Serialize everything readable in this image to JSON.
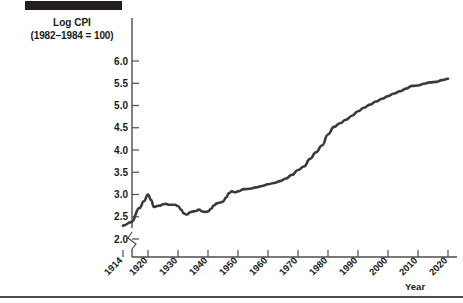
{
  "figure": {
    "header_bar_color": "#231f20",
    "rule_color": "#4d4d4d",
    "line_color": "#3a3a3a"
  },
  "axis_labels": {
    "y_title_line1": "Log CPI",
    "y_title_line2": "(1982–1984 = 100)",
    "x_title": "Year"
  },
  "chart_data": {
    "type": "line",
    "title": "Log CPI (1982–1984 = 100)",
    "xlabel": "Year",
    "ylabel": "Log CPI (1982–1984 = 100)",
    "grid": false,
    "legend": null,
    "xlim": [
      1914,
      2020
    ],
    "ylim": [
      2.0,
      6.0
    ],
    "y_axis_break": true,
    "y_axis_break_note": "zigzag break below 2.0",
    "yticks": [
      2.0,
      2.5,
      3.0,
      3.5,
      4.0,
      4.5,
      5.0,
      5.5,
      6.0
    ],
    "ytick_labels": [
      "2.0",
      "2.5",
      "3.0",
      "3.5",
      "4.0",
      "4.5",
      "5.0",
      "5.5",
      "6.0"
    ],
    "xticks": [
      1914,
      1920,
      1930,
      1940,
      1950,
      1960,
      1970,
      1980,
      1990,
      2000,
      2010,
      2020
    ],
    "xtick_labels": [
      "1914",
      "1920",
      "1930",
      "1940",
      "1950",
      "1960",
      "1970",
      "1980",
      "1990",
      "2000",
      "2010",
      "2020"
    ],
    "series": [
      {
        "name": "Log CPI",
        "x": [
          1914,
          1916,
          1918,
          1919,
          1920,
          1921,
          1922,
          1923,
          1924,
          1925,
          1926,
          1927,
          1928,
          1929,
          1930,
          1931,
          1932,
          1933,
          1934,
          1935,
          1936,
          1937,
          1938,
          1939,
          1940,
          1941,
          1942,
          1943,
          1944,
          1945,
          1946,
          1947,
          1948,
          1949,
          1950,
          1952,
          1954,
          1956,
          1958,
          1960,
          1962,
          1964,
          1966,
          1968,
          1970,
          1972,
          1974,
          1976,
          1978,
          1980,
          1982,
          1984,
          1986,
          1988,
          1990,
          1992,
          1994,
          1996,
          1998,
          2000,
          2002,
          2004,
          2006,
          2008,
          2010,
          2012,
          2014,
          2016,
          2018,
          2020
        ],
        "y": [
          2.3,
          2.38,
          2.7,
          2.85,
          3.0,
          2.88,
          2.72,
          2.74,
          2.75,
          2.78,
          2.79,
          2.77,
          2.77,
          2.77,
          2.74,
          2.66,
          2.57,
          2.55,
          2.6,
          2.62,
          2.63,
          2.66,
          2.62,
          2.61,
          2.62,
          2.68,
          2.76,
          2.8,
          2.82,
          2.84,
          2.93,
          3.03,
          3.07,
          3.05,
          3.07,
          3.12,
          3.13,
          3.16,
          3.19,
          3.23,
          3.26,
          3.3,
          3.36,
          3.44,
          3.55,
          3.63,
          3.8,
          3.95,
          4.1,
          4.35,
          4.52,
          4.6,
          4.68,
          4.77,
          4.87,
          4.95,
          5.02,
          5.09,
          5.15,
          5.21,
          5.27,
          5.32,
          5.38,
          5.44,
          5.45,
          5.49,
          5.52,
          5.53,
          5.57,
          5.6
        ]
      }
    ]
  }
}
